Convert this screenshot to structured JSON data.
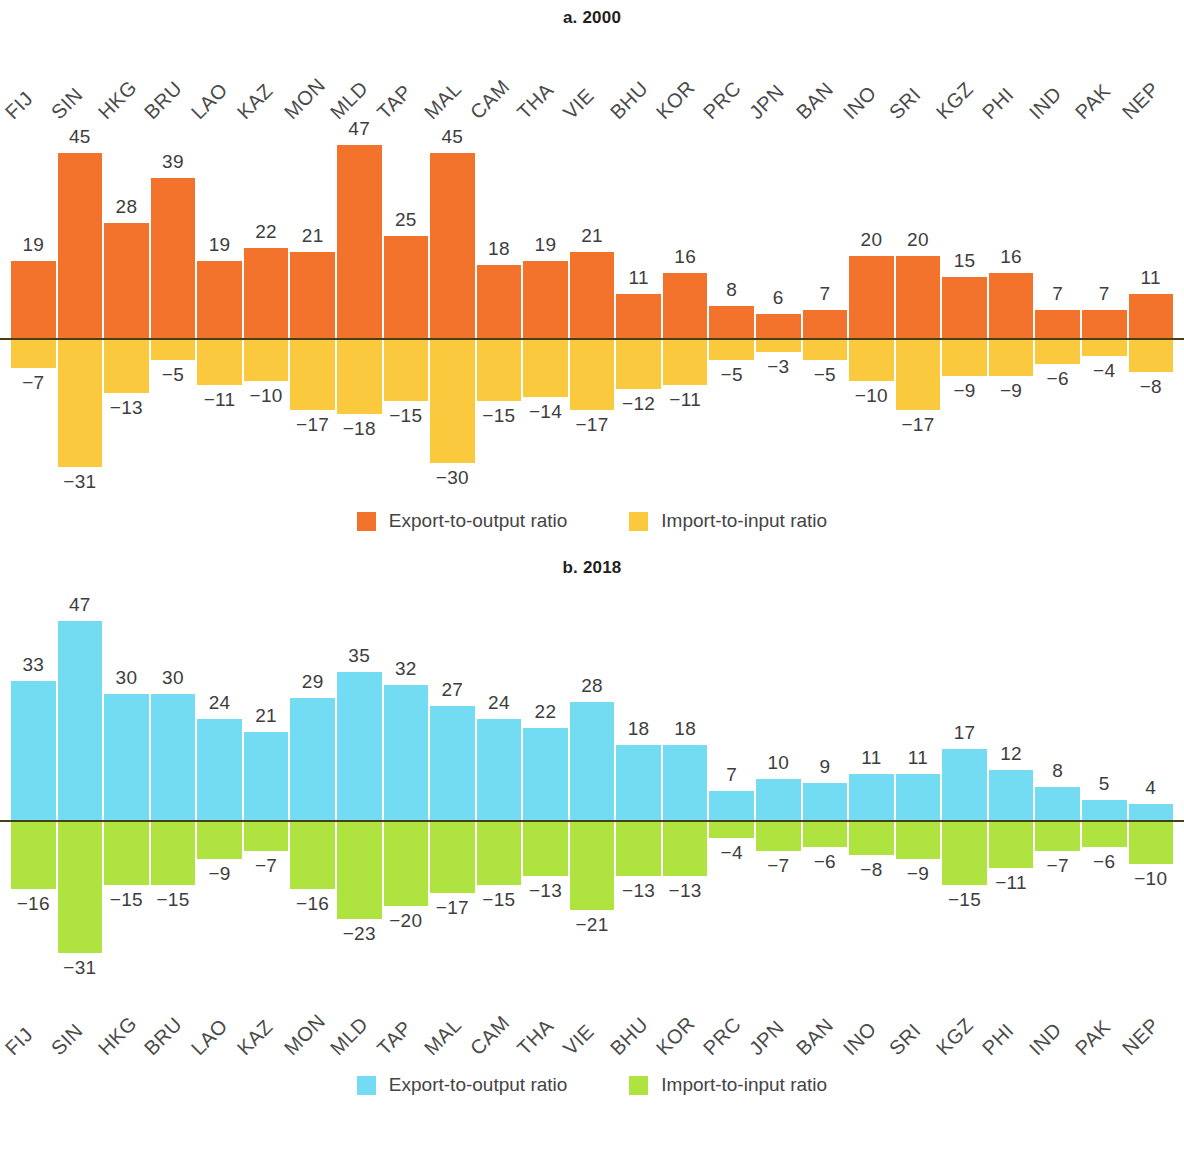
{
  "figure": {
    "panels": [
      {
        "title": "a. 2000",
        "legend": [
          {
            "label": "Export-to-output ratio",
            "color": "#F4732C"
          },
          {
            "label": "Import-to-input ratio",
            "color": "#FBC93D"
          }
        ]
      },
      {
        "title": "b. 2018",
        "legend": [
          {
            "label": "Export-to-output ratio",
            "color": "#73DCF2"
          },
          {
            "label": "Import-to-input ratio",
            "color": "#AEE340"
          }
        ]
      }
    ]
  },
  "chart_data": [
    {
      "type": "bar",
      "title": "a. 2000",
      "xlabel": "",
      "ylabel": "",
      "ylim": [
        -35,
        52
      ],
      "grid": false,
      "legend_position": "bottom",
      "axis_labels_position": "top",
      "categories": [
        "FIJ",
        "SIN",
        "HKG",
        "BRU",
        "LAO",
        "KAZ",
        "MON",
        "MLD",
        "TAP",
        "MAL",
        "CAM",
        "THA",
        "VIE",
        "BHU",
        "KOR",
        "PRC",
        "JPN",
        "BAN",
        "INO",
        "SRI",
        "KGZ",
        "PHI",
        "IND",
        "PAK",
        "NEP"
      ],
      "series": [
        {
          "name": "Export-to-output ratio",
          "color": "#F4732C",
          "values": [
            19,
            45,
            28,
            39,
            19,
            22,
            21,
            47,
            25,
            45,
            18,
            19,
            21,
            11,
            16,
            8,
            6,
            7,
            20,
            20,
            15,
            16,
            7,
            7,
            11
          ],
          "labels": [
            "19",
            "45",
            "28",
            "39",
            "19",
            "22",
            "21",
            "47",
            "25",
            "45",
            "18",
            "19",
            "21",
            "11",
            "16",
            "8",
            "6",
            "7",
            "20",
            "20",
            "15",
            "16",
            "7",
            "7",
            "11"
          ]
        },
        {
          "name": "Import-to-input ratio",
          "color": "#FBC93D",
          "values": [
            -7,
            -31,
            -13,
            -5,
            -11,
            -10,
            -17,
            -18,
            -15,
            -30,
            -15,
            -14,
            -17,
            -12,
            -11,
            -5,
            -3,
            -5,
            -10,
            -17,
            -9,
            -9,
            -6,
            -4,
            -8
          ],
          "labels": [
            "−7",
            "−31",
            "−13",
            "−5",
            "−11",
            "−10",
            "−17",
            "−18",
            "−15",
            "−30",
            "−15",
            "−14",
            "−17",
            "−12",
            "−11",
            "−5",
            "−3",
            "−5",
            "−10",
            "−17",
            "−9",
            "−9",
            "−6",
            "−4",
            "−8"
          ]
        }
      ]
    },
    {
      "type": "bar",
      "title": "b. 2018",
      "xlabel": "",
      "ylabel": "",
      "ylim": [
        -35,
        52
      ],
      "grid": false,
      "legend_position": "bottom",
      "axis_labels_position": "bottom",
      "categories": [
        "FIJ",
        "SIN",
        "HKG",
        "BRU",
        "LAO",
        "KAZ",
        "MON",
        "MLD",
        "TAP",
        "MAL",
        "CAM",
        "THA",
        "VIE",
        "BHU",
        "KOR",
        "PRC",
        "JPN",
        "BAN",
        "INO",
        "SRI",
        "KGZ",
        "PHI",
        "IND",
        "PAK",
        "NEP"
      ],
      "series": [
        {
          "name": "Export-to-output ratio",
          "color": "#73DCF2",
          "values": [
            33,
            47,
            30,
            30,
            24,
            21,
            29,
            35,
            32,
            27,
            24,
            22,
            28,
            18,
            18,
            7,
            10,
            9,
            11,
            11,
            17,
            12,
            8,
            5,
            4
          ],
          "labels": [
            "33",
            "47",
            "30",
            "30",
            "24",
            "21",
            "29",
            "35",
            "32",
            "27",
            "24",
            "22",
            "28",
            "18",
            "18",
            "7",
            "10",
            "9",
            "11",
            "11",
            "17",
            "12",
            "8",
            "5",
            "4"
          ]
        },
        {
          "name": "Import-to-input ratio",
          "color": "#AEE340",
          "values": [
            -16,
            -31,
            -15,
            -15,
            -9,
            -7,
            -16,
            -23,
            -20,
            -17,
            -15,
            -13,
            -21,
            -13,
            -13,
            -4,
            -7,
            -6,
            -8,
            -9,
            -15,
            -11,
            -7,
            -6,
            -10
          ],
          "labels": [
            "−16",
            "−31",
            "−15",
            "−15",
            "−9",
            "−7",
            "−16",
            "−23",
            "−20",
            "−17",
            "−15",
            "−13",
            "−21",
            "−13",
            "−13",
            "−4",
            "−7",
            "−6",
            "−8",
            "−9",
            "−15",
            "−11",
            "−7",
            "−6",
            "−10"
          ]
        }
      ]
    }
  ]
}
